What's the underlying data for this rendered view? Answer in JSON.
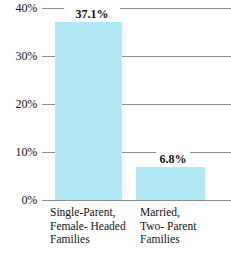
{
  "chart_data": {
    "type": "bar",
    "title": "",
    "subtitle": "",
    "xlabel": "",
    "ylabel": "",
    "categories": [
      "Single-Parent,\nFemale- Headed\nFamilies",
      "Married,\nTwo- Parent\nFamilies"
    ],
    "values": [
      37.1,
      6.8
    ],
    "value_labels": [
      "37.1%",
      "6.8%"
    ],
    "ylim": [
      0,
      40
    ],
    "ytick_values": [
      40,
      30,
      20,
      10,
      0
    ],
    "ytick_labels": [
      "40%",
      "30%",
      "20%",
      "10%",
      "0%"
    ],
    "grid": true,
    "grid_axis": "y",
    "legend": false,
    "legend_position": "none",
    "bar_color": "#b3e8f5",
    "grid_color": "#8d8d8d",
    "text_color": "#141414",
    "background_color": "#ffffff"
  }
}
